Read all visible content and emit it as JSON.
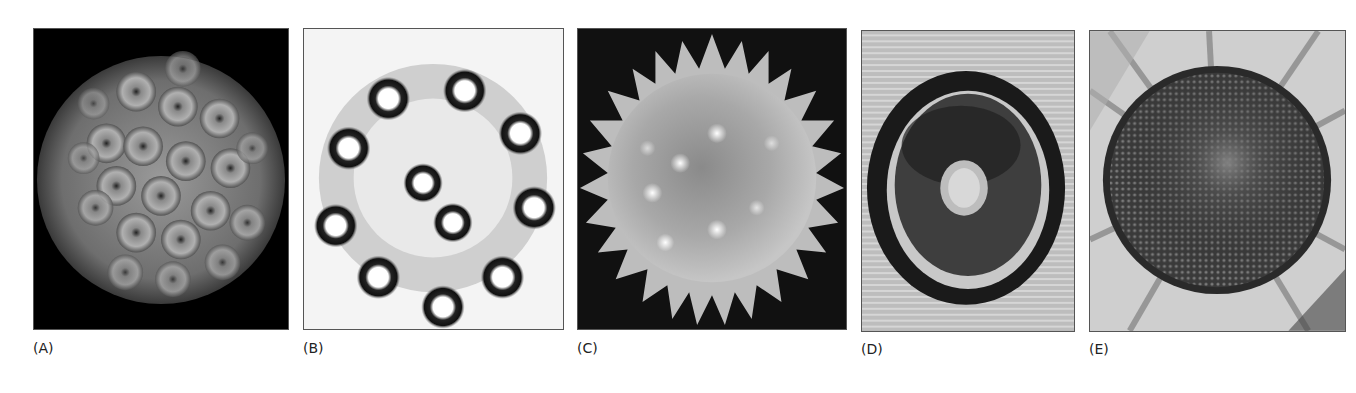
{
  "figure": {
    "panels": [
      {
        "id": "A",
        "label": "(A)",
        "subject": "icosahedral virus capsid"
      },
      {
        "id": "B",
        "label": "(B)",
        "subject": "microtubule cross-section (9+2 arrangement)"
      },
      {
        "id": "C",
        "label": "(C)",
        "subject": "spiky pollen grain"
      },
      {
        "id": "D",
        "label": "(D)",
        "subject": "concentric ring structure"
      },
      {
        "id": "E",
        "label": "(E)",
        "subject": "sunflower head with spiral florets"
      }
    ]
  }
}
